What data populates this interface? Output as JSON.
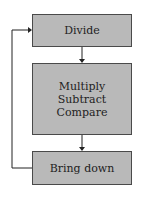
{
  "diagram": {
    "type": "flowchart-loop",
    "steps": [
      {
        "label": "Divide"
      },
      {
        "lines": [
          "Multiply",
          "Subtract",
          "Compare"
        ]
      },
      {
        "label": "Bring down"
      }
    ],
    "colors": {
      "box_fill": "#b9b9b9",
      "box_border": "#4a4a4a",
      "arrow": "#222222"
    },
    "loop": {
      "from": "Bring down",
      "to": "Divide"
    }
  }
}
